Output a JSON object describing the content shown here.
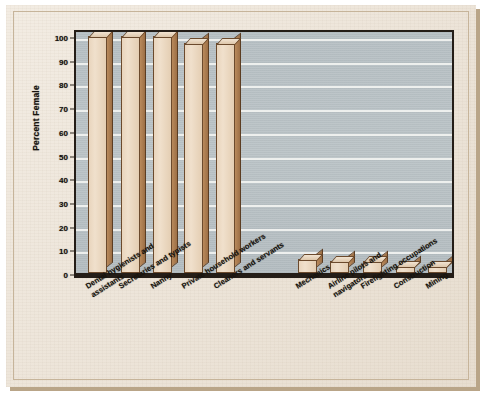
{
  "figure": {
    "media": "scanned-textbook-page",
    "paper_color": "#ece2d4",
    "plot_bg_color": "#b9c2c6",
    "gridline_color": "#f2f3f1",
    "bar_face_color": "#ecdcc5",
    "bar_side_color": "#a87a4e",
    "axis_color": "#241d17"
  },
  "chart_data": {
    "type": "bar",
    "title": "",
    "subtitle": "",
    "xlabel": "",
    "ylabel": "Percent Female",
    "ylim": [
      0,
      100
    ],
    "grid": true,
    "legend": null,
    "tick_labels_y": [
      "0",
      "10",
      "20",
      "30",
      "40",
      "50",
      "60",
      "70",
      "80",
      "90",
      "100"
    ],
    "categories": [
      "Dental hygienists and assistants",
      "Secretaries and typists",
      "Nanny",
      "Private household workers",
      "Cleaners and servants",
      "",
      "Mechanics",
      "Airline pilots and navigators",
      "Firefighting occupations",
      "Construction",
      "Mining"
    ],
    "category_lines": [
      [
        "Dental hygienists and",
        "assistants"
      ],
      [
        "Secretaries and typists"
      ],
      [
        "Nanny"
      ],
      [
        "Private household workers"
      ],
      [
        "Cleaners and servants"
      ],
      [
        ""
      ],
      [
        "Mechanics"
      ],
      [
        "Airline pilots and",
        "navigators"
      ],
      [
        "Firefighting occupations"
      ],
      [
        "Construction"
      ],
      [
        "Mining"
      ]
    ],
    "values": [
      100,
      100,
      100,
      97,
      97,
      null,
      6,
      5,
      5,
      3,
      3
    ],
    "annotations": []
  }
}
